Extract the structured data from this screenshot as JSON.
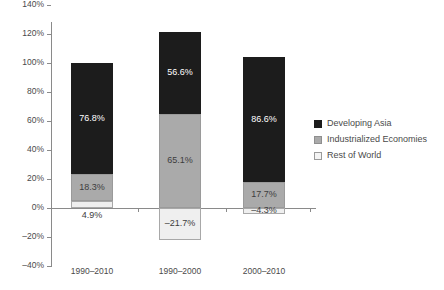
{
  "chart_data": {
    "type": "bar",
    "subtype": "stacked-bar",
    "title": "",
    "xlabel": "",
    "ylabel": "",
    "ylim": [
      -40,
      140
    ],
    "ytick_step": 20,
    "grid": false,
    "legend_position": "right",
    "categories": [
      "1990–2010",
      "1990–2000",
      "2000–2010"
    ],
    "ytick_labels": [
      "140%",
      "120%",
      "100%",
      "80%",
      "60%",
      "40%",
      "20%",
      "0%",
      "–20%",
      "–40%"
    ],
    "ytick_values": [
      140,
      120,
      100,
      80,
      60,
      40,
      20,
      0,
      -20,
      -40
    ],
    "series": [
      {
        "name": "Developing Asia",
        "color": "#1c1c1c",
        "values": [
          76.8,
          56.6,
          86.6
        ],
        "labels": [
          "76.8%",
          "56.6%",
          "86.6%"
        ]
      },
      {
        "name": "Industrialized Economies",
        "color": "#aaaaaa",
        "values": [
          18.3,
          65.1,
          17.7
        ],
        "labels": [
          "18.3%",
          "65.1%",
          "17.7%"
        ]
      },
      {
        "name": "Rest of World",
        "color": "#efefef",
        "values": [
          4.9,
          -21.7,
          -4.3
        ],
        "labels": [
          "4.9%",
          "–21.7%",
          "–4.3%"
        ]
      }
    ],
    "bar_totals": [
      100.0,
      121.7,
      104.3
    ]
  },
  "legend": {
    "items": [
      {
        "label": "Developing Asia"
      },
      {
        "label": "Industrialized Economies"
      },
      {
        "label": "Rest of World"
      }
    ]
  }
}
